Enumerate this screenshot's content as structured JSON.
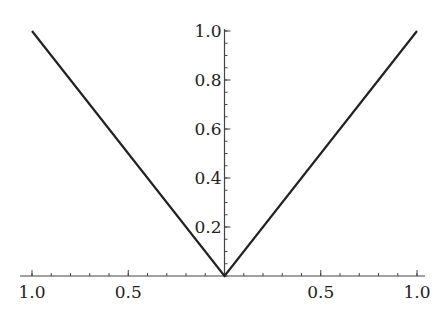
{
  "chart_data": {
    "type": "line",
    "title": "",
    "xlabel": "",
    "ylabel": "",
    "function": "y = |x|",
    "xlim": [
      -1.0,
      1.0
    ],
    "ylim": [
      0.0,
      1.0
    ],
    "grid": false,
    "legend": null,
    "series": [
      {
        "name": "|x|",
        "color": "#222222",
        "x": [
          -1.0,
          0.0,
          1.0
        ],
        "y": [
          1.0,
          0.0,
          1.0
        ]
      }
    ],
    "x_ticks": [
      -1.0,
      -0.5,
      0.5,
      1.0
    ],
    "x_tick_labels": [
      "1.0",
      "0.5",
      "0.5",
      "1.0"
    ],
    "x_minor_tick_step": 0.1,
    "y_ticks": [
      0.2,
      0.4,
      0.6,
      0.8,
      1.0
    ],
    "y_tick_labels": [
      "0.2",
      "0.4",
      "0.6",
      "0.8",
      "1.0"
    ],
    "y_minor_tick_step": 0.05
  },
  "style": {
    "line_color": "#222222",
    "axis_color": "#444444"
  }
}
